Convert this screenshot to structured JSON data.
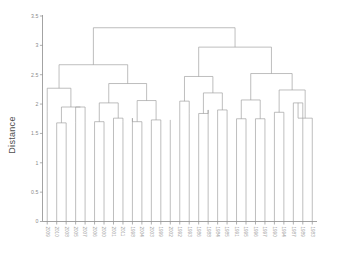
{
  "chart_data": {
    "type": "dendrogram",
    "title": "",
    "xlabel": "",
    "ylabel": "Distance",
    "ylim": [
      0,
      3.5
    ],
    "yticks": [
      "0",
      "0.5",
      "1",
      "1.5",
      "2",
      "2.5",
      "3",
      "3.5"
    ],
    "ytick_values": [
      0,
      0.5,
      1,
      1.5,
      2,
      2.5,
      3,
      3.5
    ],
    "grid": false,
    "legend": "none",
    "orientation": "top-down",
    "leaf_label_rotation": 90,
    "leaf_count": 29,
    "leaves": [
      "2009",
      "2010",
      "2008",
      "2005",
      "2007",
      "2006",
      "2000",
      "2001",
      "2011",
      "1998",
      "2004",
      "2003",
      "1999",
      "2002",
      "1992",
      "1993",
      "1986",
      "1988",
      "1984",
      "1985",
      "1991",
      "1995",
      "1996",
      "1997",
      "1990",
      "1994",
      "1987",
      "1989",
      "1983"
    ],
    "leaf_base": 0,
    "leaf_tops": [
      1.88,
      1.68,
      1.68,
      1.68,
      1.68,
      1.68,
      1.7,
      1.76,
      1.7,
      1.76,
      1.7,
      1.7,
      1.73,
      1.73,
      2.05,
      1.84,
      1.84,
      1.9,
      1.9,
      1.9,
      1.75,
      1.75,
      1.75,
      1.75,
      1.86,
      1.86,
      1.76,
      1.76,
      1.76
    ],
    "merges": [
      {
        "id": "m1",
        "left": "2010",
        "right": "2008",
        "height": 1.68
      },
      {
        "id": "m2",
        "left": "2005",
        "right": "2007",
        "height": 1.95
      },
      {
        "id": "m3",
        "left": "m1",
        "right": "m2",
        "height": 1.95
      },
      {
        "id": "m4",
        "left": "2009",
        "right": "m3",
        "height": 2.27
      },
      {
        "id": "m5",
        "left": "2006",
        "right": "2000",
        "height": 1.7
      },
      {
        "id": "m6",
        "left": "2001",
        "right": "2011",
        "height": 1.76
      },
      {
        "id": "m7",
        "left": "m5",
        "right": "m6",
        "height": 2.02
      },
      {
        "id": "m8",
        "left": "1998",
        "right": "2004",
        "height": 1.7
      },
      {
        "id": "m9",
        "left": "2003",
        "right": "1999",
        "height": 1.73
      },
      {
        "id": "m10",
        "left": "m8",
        "right": "m9",
        "height": 2.06
      },
      {
        "id": "m11",
        "left": "m7",
        "right": "m10",
        "height": 2.35
      },
      {
        "id": "m12",
        "left": "m4",
        "right": "m11",
        "height": 2.67
      },
      {
        "id": "m13",
        "left": "1992",
        "right": "1993",
        "height": 2.05
      },
      {
        "id": "m14",
        "left": "1986",
        "right": "1988",
        "height": 1.84
      },
      {
        "id": "m15",
        "left": "1984",
        "right": "1985",
        "height": 1.9
      },
      {
        "id": "m16",
        "left": "m14",
        "right": "m15",
        "height": 2.19
      },
      {
        "id": "m17",
        "left": "m13",
        "right": "m16",
        "height": 2.47
      },
      {
        "id": "m18",
        "left": "1991",
        "right": "1995",
        "height": 1.75
      },
      {
        "id": "m19",
        "left": "1996",
        "right": "1997",
        "height": 1.75
      },
      {
        "id": "m20",
        "left": "m18",
        "right": "m19",
        "height": 2.07
      },
      {
        "id": "m21",
        "left": "1990",
        "right": "1994",
        "height": 1.86
      },
      {
        "id": "m22",
        "left": "1987",
        "right": "1989",
        "height": 2.02
      },
      {
        "id": "m23",
        "left": "m22",
        "right": "1983",
        "height": 1.76
      },
      {
        "id": "m24",
        "left": "m21",
        "right": "m23",
        "height": 2.24
      },
      {
        "id": "m25",
        "left": "m20",
        "right": "m24",
        "height": 2.52
      },
      {
        "id": "m26",
        "left": "m17",
        "right": "m25",
        "height": 2.97
      },
      {
        "id": "m27",
        "left": "m12",
        "right": "m26",
        "height": 3.3
      }
    ],
    "colors": {
      "link": "#9a9a9a",
      "axis": "#8c8c8c",
      "text": "#7d7d7d",
      "title": "#4d4d4d",
      "background": "#ffffff"
    }
  },
  "axis": {
    "y_title": "Distance"
  }
}
